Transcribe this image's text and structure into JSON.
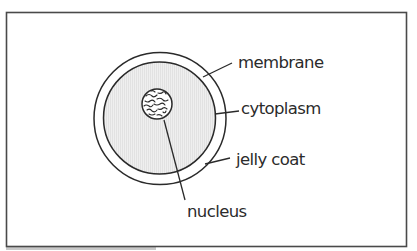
{
  "diagram": {
    "labels": {
      "membrane": "membrane",
      "cytoplasm": "cytoplasm",
      "jelly_coat": "jelly coat",
      "nucleus": "nucleus"
    },
    "colors": {
      "frame": "#4a4a4a",
      "outline": "#2a2a2a",
      "jelly_coat_fill": "#ffffff",
      "cytoplasm_fill": "#ebebeb",
      "nucleus_fill": "#ffffff",
      "text": "#2b2b2b"
    }
  }
}
